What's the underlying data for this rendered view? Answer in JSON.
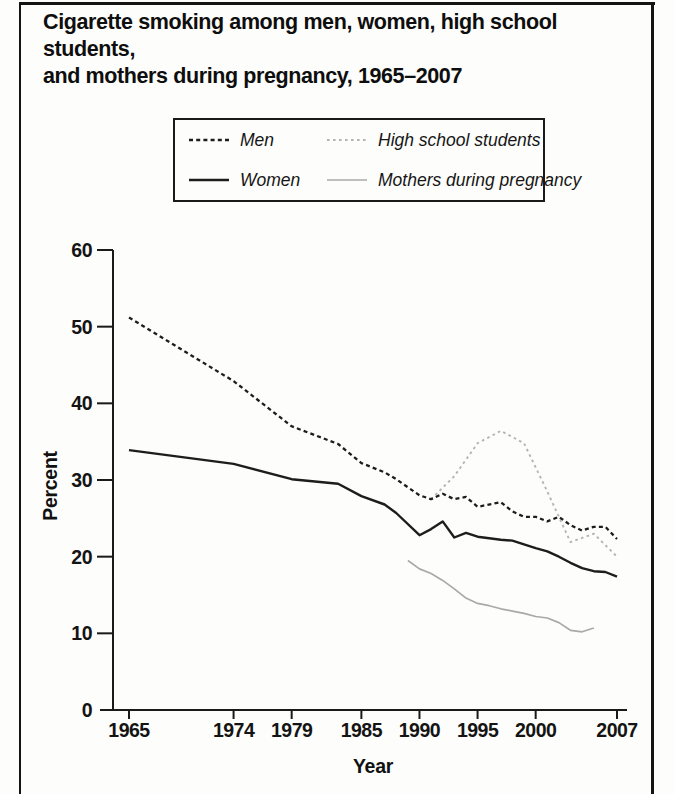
{
  "title": {
    "line1": "Cigarette smoking among men, women, high school students,",
    "line2": "and mothers during pregnancy, 1965–2007"
  },
  "legend": {
    "items": [
      {
        "label": "Men",
        "series": "men"
      },
      {
        "label": "High school students",
        "series": "high_school_students"
      },
      {
        "label": "Women",
        "series": "women"
      },
      {
        "label": "Mothers during pregnancy",
        "series": "mothers_during_pregnancy"
      }
    ]
  },
  "colors": {
    "axis": "#1a1a1a",
    "text": "#141414",
    "line_black": "#1d1d1d",
    "line_gray_dotted": "#b4b4b4",
    "line_gray_solid": "#a9a9a9",
    "background": "#fdfdfb",
    "frame": "#141414"
  },
  "chart_data": {
    "type": "line",
    "title": "Cigarette smoking among men, women, high school students, and mothers during pregnancy, 1965–2007",
    "xlabel": "Year",
    "ylabel": "Percent",
    "xlim": [
      1965,
      2007
    ],
    "ylim": [
      0,
      60
    ],
    "x_ticks": [
      1965,
      1974,
      1979,
      1985,
      1990,
      1995,
      2000,
      2007
    ],
    "y_ticks": [
      0,
      10,
      20,
      30,
      40,
      50,
      60
    ],
    "grid": false,
    "legend_position": "top-center",
    "series": [
      {
        "name": "Men",
        "key": "men",
        "color": "#1d1d1d",
        "style": "dashed",
        "dash": "4 3.2",
        "width": 2.3,
        "data": [
          [
            1965,
            51.2
          ],
          [
            1974,
            42.9
          ],
          [
            1979,
            37.0
          ],
          [
            1983,
            34.7
          ],
          [
            1985,
            32.2
          ],
          [
            1987,
            31.0
          ],
          [
            1988,
            30.1
          ],
          [
            1990,
            28.0
          ],
          [
            1991,
            27.5
          ],
          [
            1992,
            28.2
          ],
          [
            1993,
            27.5
          ],
          [
            1994,
            27.8
          ],
          [
            1995,
            26.5
          ],
          [
            1997,
            27.1
          ],
          [
            1998,
            25.9
          ],
          [
            1999,
            25.2
          ],
          [
            2000,
            25.2
          ],
          [
            2001,
            24.6
          ],
          [
            2002,
            25.2
          ],
          [
            2003,
            24.1
          ],
          [
            2004,
            23.4
          ],
          [
            2005,
            23.9
          ],
          [
            2006,
            23.9
          ],
          [
            2007,
            22.3
          ]
        ]
      },
      {
        "name": "Women",
        "key": "women",
        "color": "#1d1d1d",
        "style": "solid",
        "dash": "",
        "width": 2.4,
        "data": [
          [
            1965,
            33.9
          ],
          [
            1974,
            32.1
          ],
          [
            1979,
            30.1
          ],
          [
            1983,
            29.5
          ],
          [
            1985,
            27.9
          ],
          [
            1987,
            26.8
          ],
          [
            1988,
            25.7
          ],
          [
            1990,
            22.8
          ],
          [
            1991,
            23.6
          ],
          [
            1992,
            24.6
          ],
          [
            1993,
            22.5
          ],
          [
            1994,
            23.1
          ],
          [
            1995,
            22.6
          ],
          [
            1997,
            22.2
          ],
          [
            1998,
            22.1
          ],
          [
            1999,
            21.6
          ],
          [
            2000,
            21.1
          ],
          [
            2001,
            20.7
          ],
          [
            2002,
            20.0
          ],
          [
            2003,
            19.2
          ],
          [
            2004,
            18.5
          ],
          [
            2005,
            18.1
          ],
          [
            2006,
            18.0
          ],
          [
            2007,
            17.4
          ]
        ]
      },
      {
        "name": "High school students",
        "key": "high_school_students",
        "color": "#b4b4b4",
        "style": "dotted",
        "dash": "2.6 3.4",
        "width": 1.9,
        "data": [
          [
            1991,
            27.5
          ],
          [
            1993,
            30.5
          ],
          [
            1995,
            34.8
          ],
          [
            1997,
            36.4
          ],
          [
            1999,
            34.8
          ],
          [
            2001,
            28.5
          ],
          [
            2003,
            21.9
          ],
          [
            2005,
            23.0
          ],
          [
            2007,
            20.0
          ]
        ]
      },
      {
        "name": "Mothers during pregnancy",
        "key": "mothers_during_pregnancy",
        "color": "#a9a9a9",
        "style": "solid",
        "dash": "",
        "width": 1.7,
        "data": [
          [
            1989,
            19.5
          ],
          [
            1990,
            18.4
          ],
          [
            1991,
            17.8
          ],
          [
            1992,
            16.9
          ],
          [
            1993,
            15.8
          ],
          [
            1994,
            14.6
          ],
          [
            1995,
            13.9
          ],
          [
            1996,
            13.6
          ],
          [
            1997,
            13.2
          ],
          [
            1998,
            12.9
          ],
          [
            1999,
            12.6
          ],
          [
            2000,
            12.2
          ],
          [
            2001,
            12.0
          ],
          [
            2002,
            11.4
          ],
          [
            2003,
            10.4
          ],
          [
            2004,
            10.2
          ],
          [
            2005,
            10.7
          ]
        ]
      }
    ]
  }
}
